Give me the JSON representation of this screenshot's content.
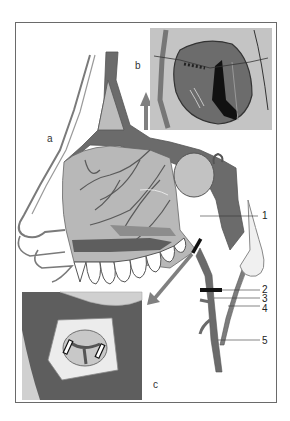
{
  "figure": {
    "panel_labels": {
      "a": "a",
      "b": "b",
      "c": "c"
    },
    "callouts": [
      {
        "id": "1",
        "label": "1"
      },
      {
        "id": "2",
        "label": "2"
      },
      {
        "id": "3",
        "label": "3"
      },
      {
        "id": "4",
        "label": "4"
      },
      {
        "id": "5",
        "label": "5"
      }
    ],
    "colors": {
      "vessel": "#6b6b6b",
      "mucosa": "#b8b8b8",
      "bone_dark": "#5e5e5e",
      "inset_bg": "#c4c4c4",
      "outline": "#5a5a5a",
      "clip": "#111111"
    }
  }
}
